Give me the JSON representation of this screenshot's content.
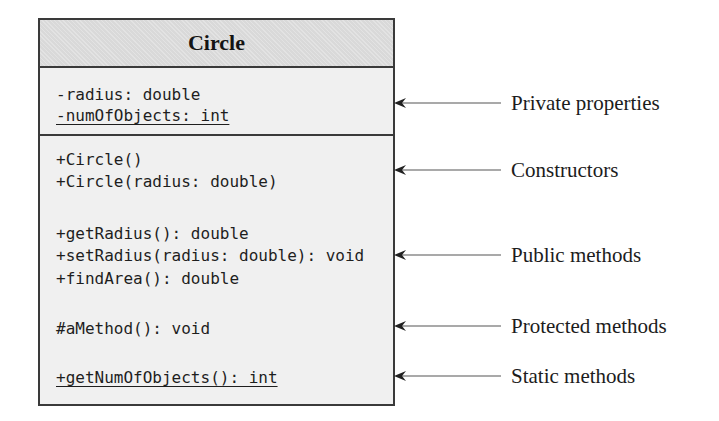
{
  "class_diagram": {
    "class_name": "Circle",
    "properties": [
      {
        "text": "-radius: double",
        "visibility": "private",
        "static": false
      },
      {
        "text": "-numOfObjects: int",
        "visibility": "private",
        "static": true
      }
    ],
    "methods": [
      {
        "text": "+Circle()",
        "visibility": "public",
        "static": false,
        "group": "constructors"
      },
      {
        "text": "+Circle(radius: double)",
        "visibility": "public",
        "static": false,
        "group": "constructors"
      },
      {
        "text": "+getRadius(): double",
        "visibility": "public",
        "static": false,
        "group": "public"
      },
      {
        "text": "+setRadius(radius: double): void",
        "visibility": "public",
        "static": false,
        "group": "public"
      },
      {
        "text": "+findArea(): double",
        "visibility": "public",
        "static": false,
        "group": "public"
      },
      {
        "text": "#aMethod(): void",
        "visibility": "protected",
        "static": false,
        "group": "protected"
      },
      {
        "text": "+getNumOfObjects(): int",
        "visibility": "public",
        "static": true,
        "group": "static"
      }
    ]
  },
  "annotations": [
    {
      "label": "Private properties",
      "arrow": "left-arrow"
    },
    {
      "label": "Constructors",
      "arrow": "left-arrow"
    },
    {
      "label": "Public methods",
      "arrow": "left-arrow"
    },
    {
      "label": "Protected methods",
      "arrow": "left-arrow"
    },
    {
      "label": "Static methods",
      "arrow": "left-arrow"
    }
  ],
  "colors": {
    "border": "#3a3a3a",
    "header_bg": "#d9d9d9",
    "body_bg": "#f0f0f0",
    "text": "#1e1e1e"
  }
}
